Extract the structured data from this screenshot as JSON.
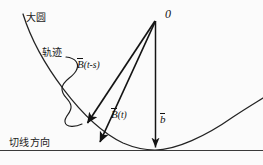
{
  "figure": {
    "background_color": "#fbfbfb",
    "stroke_color": "#1a1a1a",
    "width": 263,
    "height": 165,
    "labels": {
      "great_circle": "大圆",
      "trajectory": "轨迹",
      "tangent_direction": "切线方向",
      "origin_point": "0",
      "vector_b_t_minus_s_overbar": "B",
      "vector_b_t_minus_s_arg": "(t-s)",
      "vector_b_t_overbar": "B",
      "vector_b_t_arg": "(t)",
      "vector_b_overbar": "b"
    },
    "geometry": {
      "origin_point_xy": [
        155,
        20
      ],
      "tangent_line_y": 150,
      "arc_start_xy": [
        23,
        14
      ],
      "arc_bottom_xy": [
        155,
        150
      ],
      "arc_end_xy": [
        263,
        99
      ],
      "vector_b_t_minus_s_tip_xy": [
        85,
        125
      ],
      "vector_b_t_tip_xy": [
        98,
        144
      ],
      "vector_b_tip_xy": [
        155,
        150
      ]
    }
  }
}
